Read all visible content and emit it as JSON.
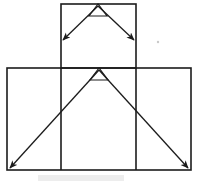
{
  "canvas": {
    "width": 199,
    "height": 183,
    "background": "#ffffff",
    "ink_color": "#1c1c1c",
    "faint_color": "#b9b9b9"
  },
  "figure": {
    "title": "",
    "stroke_width": 1.6,
    "arrow_stroke_width": 1.3
  },
  "shapes": {
    "upper_rectangle": {
      "name": "upper-rectangle",
      "x": 61,
      "y": 4,
      "width": 75,
      "height": 64,
      "stroke": "#1c1c1c"
    },
    "lower_rectangle": {
      "name": "lower-rectangle",
      "x": 7,
      "y": 68,
      "width": 184,
      "height": 102,
      "stroke": "#1c1c1c"
    },
    "inner_vertical_left": {
      "name": "inner-vertical-divider-left",
      "x": 61,
      "y1": 68,
      "y2": 170
    },
    "inner_vertical_right": {
      "name": "inner-vertical-divider-right",
      "x": 136,
      "y1": 68,
      "y2": 170
    }
  },
  "apex_markers": {
    "upper": {
      "name": "upper-apex-triangle",
      "apex_x": 98,
      "apex_y": 4,
      "left_x": 89,
      "left_y": 16,
      "right_x": 107,
      "right_y": 16
    },
    "lower": {
      "name": "lower-apex-triangle",
      "apex_x": 99,
      "apex_y": 68,
      "left_x": 90,
      "left_y": 80,
      "right_x": 108,
      "right_y": 80
    }
  },
  "arrows": {
    "upper_left": {
      "name": "arrow-upper-left",
      "x1": 98,
      "y1": 6,
      "x2": 63,
      "y2": 40,
      "direction": "down-left"
    },
    "upper_right": {
      "name": "arrow-upper-right",
      "x1": 98,
      "y1": 6,
      "x2": 134,
      "y2": 40,
      "direction": "down-right"
    },
    "lower_left": {
      "name": "arrow-lower-left",
      "x1": 99,
      "y1": 70,
      "x2": 10,
      "y2": 168,
      "direction": "down-left"
    },
    "lower_right": {
      "name": "arrow-lower-right",
      "x1": 99,
      "y1": 70,
      "x2": 188,
      "y2": 168,
      "direction": "down-right"
    }
  },
  "artifacts": {
    "speck": {
      "name": "scan-speck",
      "x": 158,
      "y": 42,
      "r": 1.2
    },
    "smudge_caption": {
      "name": "faint-caption-smudge",
      "x": 38,
      "y": 175,
      "width": 86,
      "height": 6
    }
  }
}
